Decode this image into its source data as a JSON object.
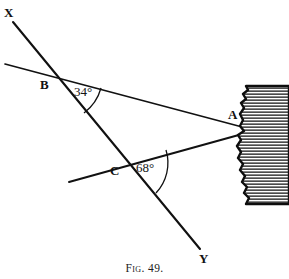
{
  "figure": {
    "caption_prefix": "Fig.",
    "caption_number": "49.",
    "caption_full": "Fig. 49.",
    "background_color": "#ffffff",
    "ink_color": "#111111"
  },
  "labels": {
    "x_endpoint": "X",
    "y_endpoint": "Y",
    "vertex_a": "A",
    "vertex_b": "B",
    "vertex_c": "C"
  },
  "angles": {
    "at_b": {
      "value": "34",
      "degree_symbol": "°",
      "text": "34°"
    },
    "at_c": {
      "value": "68",
      "degree_symbol": "°",
      "text": "68°"
    }
  },
  "geometry": {
    "line_xy": {
      "name": "line-x-y",
      "from": [
        13,
        22
      ],
      "to": [
        200,
        249
      ]
    },
    "line_b_a": {
      "name": "line-b-a",
      "from": [
        5,
        64
      ],
      "to": [
        246,
        128
      ]
    },
    "line_c_a": {
      "name": "line-c-a",
      "from": [
        69,
        182
      ],
      "to": [
        246,
        133
      ]
    },
    "points": {
      "A": [
        243,
        130
      ],
      "B": [
        55,
        76
      ],
      "C": [
        123,
        165
      ]
    },
    "arc_b": {
      "name": "angle-arc-34",
      "start": [
        101,
        88
      ],
      "end": [
        84,
        113
      ]
    },
    "arc_c": {
      "name": "angle-arc-68",
      "start": [
        166,
        150
      ],
      "end": [
        156,
        193
      ]
    }
  },
  "shore": {
    "name": "hatched-shoreline",
    "description": "hatched coastline region at right edge",
    "hatch_line_count": 44
  }
}
